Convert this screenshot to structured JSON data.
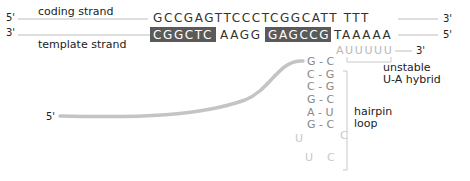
{
  "labels": {
    "coding_strand": "coding strand",
    "template_strand": "template strand",
    "coding_5": "5'",
    "coding_3": "3'",
    "template_3": "3'",
    "template_5": "5'",
    "rna_3": "3'",
    "rna_5": "5'"
  },
  "sequences": {
    "coding": "GCCGAGTTCCCTCGGCATT TTT",
    "template_box1": "CGGCTC",
    "template_mid": "AAGG",
    "template_box2": "GAGCCG",
    "template_tail": "TAAAAA",
    "rna_tail": "AUUUUU"
  },
  "hairpin": {
    "pairs": [
      "G - C",
      "C - G",
      "C - G",
      "G - C",
      "A - U",
      "G - C"
    ],
    "loop_left_1": "U",
    "loop_right_1": "C",
    "loop_left_2": "U",
    "loop_right_2": "C"
  },
  "annotations": {
    "hybrid_line1": "unstable",
    "hybrid_line2": "U-A hybrid",
    "hairpin_line1": "hairpin",
    "hairpin_line2": "loop"
  },
  "colors": {
    "highlight_box": "#5a5a5a",
    "rna_strand": "#c4c4c4",
    "strand_line": "#bdbdbd"
  }
}
